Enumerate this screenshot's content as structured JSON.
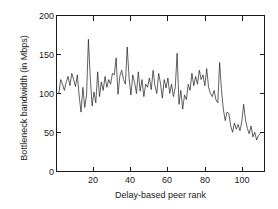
{
  "chart_data": {
    "type": "line",
    "title": "",
    "xlabel": "Delay-based peer rank",
    "ylabel": "Bottleneck bandwidth (in Mbps)",
    "xlim": [
      0,
      112
    ],
    "ylim": [
      0,
      200
    ],
    "grid": false,
    "legend": null,
    "line_color": "#1a1a1a",
    "xticks": [
      20,
      40,
      60,
      80,
      100
    ],
    "yticks": [
      0,
      50,
      100,
      150,
      200
    ],
    "series": [
      {
        "name": "Bottleneck bandwidth",
        "x": [
          1,
          2,
          3,
          4,
          5,
          6,
          7,
          8,
          9,
          10,
          11,
          12,
          13,
          14,
          15,
          16,
          17,
          18,
          19,
          20,
          21,
          22,
          23,
          24,
          25,
          26,
          27,
          28,
          29,
          30,
          31,
          32,
          33,
          34,
          35,
          36,
          37,
          38,
          39,
          40,
          41,
          42,
          43,
          44,
          45,
          46,
          47,
          48,
          49,
          50,
          51,
          52,
          53,
          54,
          55,
          56,
          57,
          58,
          59,
          60,
          61,
          62,
          63,
          64,
          65,
          66,
          67,
          68,
          69,
          70,
          71,
          72,
          73,
          74,
          75,
          76,
          77,
          78,
          79,
          80,
          81,
          82,
          83,
          84,
          85,
          86,
          87,
          88,
          89,
          90,
          91,
          92,
          93,
          94,
          95,
          96,
          97,
          98,
          99,
          100,
          101,
          102,
          103,
          104,
          105,
          106,
          107,
          108,
          109,
          110
        ],
        "values": [
          100,
          118,
          112,
          104,
          115,
          122,
          110,
          126,
          118,
          109,
          124,
          97,
          76,
          108,
          82,
          98,
          170,
          120,
          84,
          102,
          88,
          128,
          96,
          115,
          104,
          122,
          108,
          118,
          112,
          126,
          124,
          146,
          99,
          122,
          130,
          118,
          112,
          160,
          120,
          98,
          124,
          114,
          100,
          128,
          103,
          118,
          96,
          112,
          108,
          120,
          105,
          130,
          110,
          100,
          126,
          113,
          94,
          118,
          107,
          120,
          100,
          112,
          96,
          108,
          152,
          86,
          104,
          80,
          98,
          92,
          112,
          104,
          126,
          110,
          122,
          112,
          130,
          118,
          124,
          110,
          132,
          108,
          100,
          96,
          104,
          92,
          88,
          140,
          104,
          80,
          65,
          76,
          74,
          58,
          50,
          62,
          54,
          60,
          52,
          64,
          86,
          66,
          55,
          48,
          58,
          44,
          50,
          40,
          46,
          48
        ]
      }
    ]
  },
  "axes": {
    "ytick_labels": [
      "0",
      "50",
      "100",
      "150",
      "200"
    ],
    "xtick_labels": [
      "20",
      "40",
      "60",
      "80",
      "100"
    ]
  }
}
